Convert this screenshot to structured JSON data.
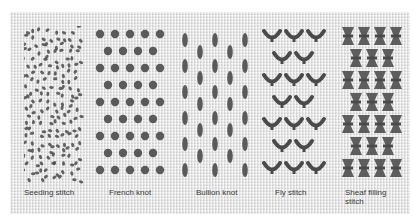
{
  "figure": {
    "stitches": [
      {
        "name": "seeding",
        "label": "Seeding stitch"
      },
      {
        "name": "french-knot",
        "label": "French knot"
      },
      {
        "name": "bullion-knot",
        "label": "Bullion knot"
      },
      {
        "name": "fly-stitch",
        "label": "Fly stitch"
      },
      {
        "name": "sheaf-filling",
        "label": "Sheaf filling stitch",
        "label_line1": "Sheaf filling",
        "label_line2": "stitch"
      }
    ],
    "colors": {
      "fabric": "#e6e6e6",
      "thread": "#4a4a4a",
      "text": "#3a3a3a"
    }
  }
}
